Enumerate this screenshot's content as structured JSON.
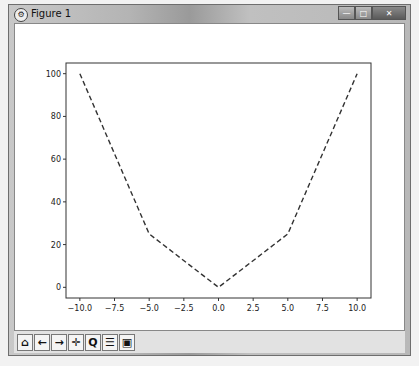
{
  "window": {
    "title": "Figure 1",
    "buttons": {
      "minimize": "—",
      "maximize": "□",
      "close": "✕"
    }
  },
  "toolbar": {
    "items": [
      {
        "name": "home-icon",
        "glyph": "⌂"
      },
      {
        "name": "back-arrow-icon",
        "glyph": "←"
      },
      {
        "name": "forward-arrow-icon",
        "glyph": "→"
      },
      {
        "name": "pan-icon",
        "glyph": "✛"
      },
      {
        "name": "zoom-icon",
        "glyph": "Q"
      },
      {
        "name": "configure-subplots-icon",
        "glyph": "☰"
      },
      {
        "name": "save-icon",
        "glyph": "▣"
      }
    ]
  },
  "chart_data": {
    "type": "line",
    "title": "",
    "xlabel": "",
    "ylabel": "",
    "x": [
      -10,
      -5,
      0,
      5,
      10
    ],
    "series": [
      {
        "name": "y",
        "values": [
          100,
          25,
          0,
          25,
          100
        ],
        "style": "dashed",
        "color": "#333333"
      }
    ],
    "xticks": [
      "-10.0",
      "-7.5",
      "-5.0",
      "-2.5",
      "0.0",
      "2.5",
      "5.0",
      "7.5",
      "10.0"
    ],
    "yticks": [
      "0",
      "20",
      "40",
      "60",
      "80",
      "100"
    ],
    "xlim": [
      -11,
      11
    ],
    "ylim": [
      -5,
      105
    ],
    "grid": false,
    "legend": null
  }
}
